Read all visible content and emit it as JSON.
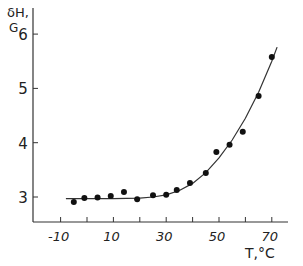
{
  "chart_data": {
    "type": "scatter",
    "title": "",
    "xlabel": "T,°C",
    "ylabel": "δH, G",
    "ylabel_line1": "δH,",
    "ylabel_line2": "G",
    "x_ticks": [
      -10,
      0,
      10,
      20,
      30,
      40,
      50,
      60,
      70
    ],
    "x_tick_labels": [
      "-10",
      "10",
      "30",
      "50",
      "70"
    ],
    "x_tick_label_values": [
      -10,
      10,
      30,
      50,
      70
    ],
    "y_ticks": [
      3,
      4,
      5,
      6
    ],
    "y_tick_labels": [
      "3",
      "4",
      "5",
      "6"
    ],
    "xlim": [
      -19,
      82
    ],
    "ylim": [
      2.53,
      6.5
    ],
    "grid": false,
    "legend": null,
    "series": [
      {
        "name": "measured",
        "marker": "filled-circle",
        "x": [
          -5,
          -1,
          4,
          9,
          14,
          19,
          25,
          30,
          34,
          39,
          45,
          49,
          54,
          59,
          65,
          70
        ],
        "y": [
          2.91,
          2.98,
          2.99,
          3.02,
          3.09,
          2.96,
          3.03,
          3.04,
          3.13,
          3.26,
          3.44,
          3.83,
          3.96,
          4.2,
          4.86,
          5.58
        ]
      },
      {
        "name": "fit",
        "style": "line",
        "x": [
          -8,
          0,
          10,
          20,
          25,
          30,
          35,
          40,
          45,
          50,
          55,
          60,
          65,
          70,
          72
        ],
        "y": [
          2.97,
          2.97,
          2.97,
          2.98,
          3.0,
          3.04,
          3.12,
          3.25,
          3.45,
          3.72,
          4.05,
          4.45,
          4.93,
          5.5,
          5.76
        ]
      }
    ]
  },
  "colors": {
    "ink": "#222222",
    "background": "#ffffff"
  }
}
